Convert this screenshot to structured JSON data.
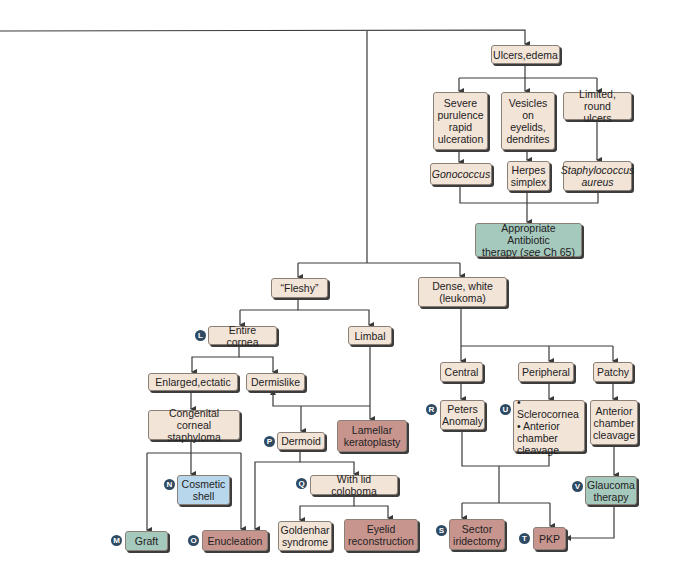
{
  "nodes": {
    "ulcers_edema": "Ulcers,edema",
    "severe": "Severe\npurulence\nrapid\nulceration",
    "vesicles": "Vesicles\non\neyelids,\ndendrites",
    "limited": "Limited, round\nulcers",
    "gonococcus": "Gonococcus",
    "herpes": "Herpes\nsimplex",
    "staph": "Staphylococcus\naureus",
    "antibiotic_a": "Appropriate Antibiotic",
    "antibiotic_b1": "therapy (",
    "antibiotic_see": "see",
    "antibiotic_b2": " Ch 65)",
    "fleshy": "“Fleshy”",
    "dense": "Dense, white\n(leukoma)",
    "entire_cornea": "Entire cornea",
    "limbal": "Limbal",
    "enlarged": "Enlarged,ectatic",
    "dermislike": "Dermislike",
    "congenital": "Congenital corneal\nstaphyloma",
    "lamellar": "Lamellar\nkeratoplasty",
    "dermoid": "Dermoid",
    "cosmetic": "Cosmetic\nshell",
    "lid_coloboma": "With lid coloboma",
    "graft": "Graft",
    "enucleation": "Enucleation",
    "goldenhar": "Goldenhar\nsyndrome",
    "eyelid": "Eyelid\nreconstruction",
    "central": "Central",
    "peripheral": "Peripheral",
    "patchy": "Patchy",
    "peters": "Peters\nAnomaly",
    "sclero": "• Sclerocornea\n• Anterior\n   chamber\n   cleavage",
    "acc": "Anterior\nchamber\ncleavage",
    "glaucoma": "Glaucoma\ntherapy",
    "sector": "Sector\niridectomy",
    "pkp": "PKP"
  },
  "badges": {
    "L": "L",
    "M": "M",
    "N": "N",
    "O": "O",
    "P": "P",
    "Q": "Q",
    "R": "R",
    "S": "S",
    "T": "T",
    "U": "U",
    "V": "V"
  },
  "colors": {
    "beige": "#f3e4d8",
    "blue": "#b8d6ec",
    "green": "#a6c9bd",
    "red": "#c8958e",
    "badge": "#2f4a63",
    "line": "#3a3a3a"
  }
}
